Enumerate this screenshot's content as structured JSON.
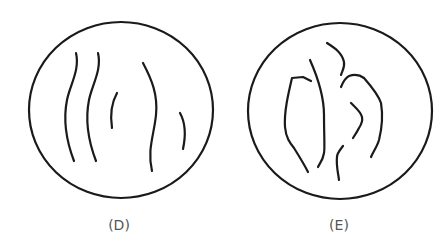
{
  "panels": [
    {
      "id": "D",
      "label": "(D)",
      "description": "circle with five separate wavy vertical strands"
    },
    {
      "id": "E",
      "label": "(E)",
      "description": "circle with six irregular curved strands forming branching shapes"
    }
  ],
  "colors": {
    "stroke": "#1a1a1a",
    "label": "#555555",
    "background": "#ffffff"
  }
}
